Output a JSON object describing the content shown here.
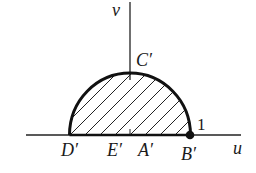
{
  "diagram": {
    "axes": {
      "horizontal_label": "u",
      "vertical_label": "v"
    },
    "points": {
      "C": "C′",
      "D": "D′",
      "E": "E′",
      "A": "A′",
      "B": "B′"
    },
    "value_label": "1",
    "region": "upper half-disk (hatched)"
  }
}
